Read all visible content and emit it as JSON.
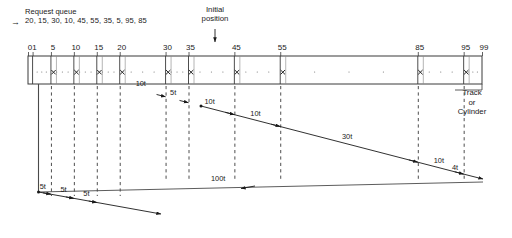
{
  "header": {
    "request_queue_title": "Request queue",
    "request_queue_values": "20, 15, 30, 10, 45, 55, 35, 5, 95, 85",
    "inbound_arrow_icon": "right-arrow-icon",
    "initial_position_line1": "Initial",
    "initial_position_line2": "position",
    "initial_position_arrow_icon": "down-arrow-icon",
    "initial_position_track": 20
  },
  "axis": {
    "label_line1": "Track",
    "label_line2": "or",
    "label_line3": "Cylinder",
    "min": 0,
    "max": 99,
    "ticks": [
      0,
      1,
      5,
      10,
      15,
      20,
      30,
      35,
      45,
      55,
      85,
      95,
      99
    ],
    "tick_labels": [
      "0",
      "1",
      "5",
      "10",
      "15",
      "20",
      "30",
      "35",
      "45",
      "55",
      "85",
      "95",
      "99"
    ],
    "cell_boundaries": [
      0,
      1,
      5,
      10,
      15,
      20,
      30,
      35,
      45,
      55,
      85,
      95,
      99
    ],
    "request_marks": [
      5,
      10,
      15,
      20,
      30,
      35,
      45,
      55,
      85,
      95
    ],
    "mark_glyph": "x"
  },
  "guides": {
    "dashed_tracks": [
      5,
      10,
      15,
      20,
      30,
      35,
      45,
      55,
      85,
      95
    ],
    "solid_track": 1
  },
  "chart_data": {
    "type": "line",
    "xlabel": "Track or Cylinder",
    "ylabel": "",
    "xlim": [
      0,
      99
    ],
    "grid": "dashed-vertical",
    "legend": "none",
    "series": [
      {
        "name": "descending-sweep",
        "points": [
          20,
          30,
          35,
          45,
          55,
          85,
          95
        ],
        "segment_labels": [
          "10t",
          "5t",
          "10t",
          "10t",
          "30t",
          "10t"
        ],
        "segment_costs": [
          10,
          5,
          10,
          10,
          30,
          10
        ]
      },
      {
        "name": "final-step",
        "points": [
          95,
          99
        ],
        "segment_labels": [
          "4t"
        ],
        "segment_costs": [
          4
        ]
      },
      {
        "name": "return-sweep",
        "points": [
          99,
          1
        ],
        "segment_labels": [
          "100t"
        ],
        "segment_costs": [
          100
        ]
      },
      {
        "name": "ascending-service",
        "points": [
          1,
          5,
          10,
          15
        ],
        "segment_labels": [
          "5t",
          "5t",
          "5t"
        ],
        "segment_costs": [
          5,
          5,
          5
        ]
      }
    ],
    "all_seek_labels": [
      "10t",
      "5t",
      "10t",
      "10t",
      "30t",
      "10t",
      "4t",
      "100t",
      "5t",
      "5t",
      "5t"
    ],
    "total_seek_time": 199
  }
}
